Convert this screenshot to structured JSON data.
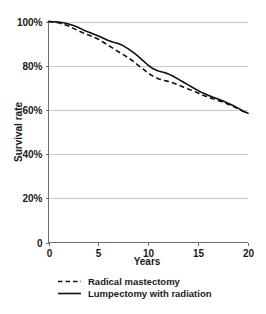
{
  "chart_data": {
    "type": "line",
    "title": "",
    "xlabel": "Years",
    "ylabel": "Survival rate",
    "xlim": [
      0,
      20
    ],
    "ylim": [
      0,
      100
    ],
    "grid": true,
    "legend_position": "bottom-left",
    "xticks": [
      0,
      5,
      10,
      15,
      20
    ],
    "xtick_labels": [
      "0",
      "5",
      "10",
      "15",
      "20"
    ],
    "yticks": [
      0,
      20,
      40,
      60,
      80,
      100
    ],
    "ytick_labels": [
      "0",
      "20%",
      "40%",
      "60%",
      "80%",
      "100%"
    ],
    "x": [
      0,
      0.5,
      1,
      1.5,
      2,
      2.5,
      3,
      3.5,
      4,
      4.5,
      5,
      5.5,
      6,
      6.5,
      7,
      7.5,
      8,
      8.5,
      9,
      9.5,
      10,
      10.5,
      11,
      11.5,
      12,
      12.5,
      13,
      13.5,
      14,
      14.5,
      15,
      15.5,
      16,
      16.5,
      17,
      17.5,
      18,
      18.5,
      19,
      19.5,
      20
    ],
    "series": [
      {
        "name": "Radical mastectomy",
        "style": "dashed",
        "color": "#111111",
        "values": [
          100,
          99.8,
          99.4,
          98.8,
          98.0,
          96.9,
          95.8,
          94.8,
          93.9,
          93.0,
          92.0,
          90.6,
          89.2,
          87.8,
          86.3,
          85.0,
          83.6,
          82.0,
          80.2,
          78.4,
          76.6,
          75.2,
          74.1,
          73.4,
          72.9,
          72.2,
          71.3,
          70.4,
          69.5,
          68.6,
          67.6,
          66.6,
          65.7,
          65.0,
          64.3,
          63.5,
          62.6,
          61.6,
          60.5,
          59.4,
          58.6
        ]
      },
      {
        "name": "Lumpectomy with radiation",
        "style": "solid",
        "color": "#111111",
        "values": [
          100,
          99.9,
          99.7,
          99.4,
          98.9,
          98.2,
          97.3,
          96.2,
          95.2,
          94.3,
          93.4,
          92.4,
          91.4,
          90.6,
          90.0,
          89.0,
          87.6,
          86.0,
          84.2,
          82.2,
          80.2,
          78.6,
          77.6,
          77.0,
          76.3,
          75.2,
          73.9,
          72.6,
          71.3,
          70.0,
          68.7,
          67.6,
          66.6,
          65.7,
          64.9,
          64.0,
          63.0,
          62.0,
          60.8,
          59.5,
          58.5
        ]
      }
    ],
    "legend": [
      {
        "label": "Radical mastectomy",
        "style": "dashed"
      },
      {
        "label": "Lumpectomy with radiation",
        "style": "solid"
      }
    ]
  }
}
